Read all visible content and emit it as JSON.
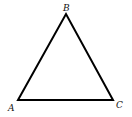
{
  "diagram": {
    "type": "triangle",
    "stroke_color": "#000000",
    "vertices": [
      {
        "label": "A",
        "x": 18,
        "y": 100
      },
      {
        "label": "B",
        "x": 66,
        "y": 14
      },
      {
        "label": "C",
        "x": 113,
        "y": 100
      }
    ],
    "labels": {
      "a": "A",
      "b": "B",
      "c": "C"
    }
  }
}
